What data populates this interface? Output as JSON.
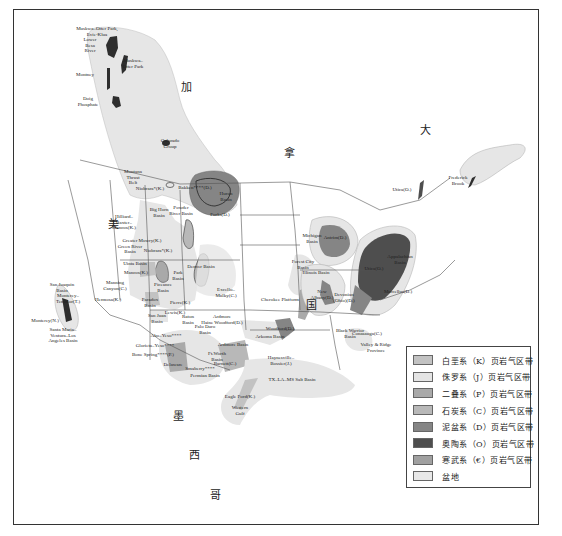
{
  "map": {
    "country_labels": [
      {
        "text": "加",
        "x": 186,
        "y": 84
      },
      {
        "text": "拿",
        "x": 289,
        "y": 150
      },
      {
        "text": "大",
        "x": 425,
        "y": 127
      },
      {
        "text": "美",
        "x": 113,
        "y": 221
      },
      {
        "text": "国",
        "x": 311,
        "y": 302
      },
      {
        "text": "墨",
        "x": 178,
        "y": 413
      },
      {
        "text": "西",
        "x": 194,
        "y": 452
      },
      {
        "text": "哥",
        "x": 215,
        "y": 492
      }
    ],
    "feature_labels": [
      {
        "text": "Muskwa–Otter Park,\nEvie-Klua",
        "x": 97,
        "y": 31
      },
      {
        "text": "Lower\nBesa\nRiver",
        "x": 90,
        "y": 45
      },
      {
        "text": "Muskwa–\nOtter Park",
        "x": 133,
        "y": 63
      },
      {
        "text": "Montney",
        "x": 85,
        "y": 75
      },
      {
        "text": "Doig\nPhosphate",
        "x": 88,
        "y": 101
      },
      {
        "text": "Colorado\nGroup",
        "x": 170,
        "y": 143
      },
      {
        "text": "Montana\nThrust\nBelt",
        "x": 133,
        "y": 177
      },
      {
        "text": "Niobrara*(K.)",
        "x": 150,
        "y": 189
      },
      {
        "text": "Bakken****(D.)",
        "x": 195,
        "y": 188
      },
      {
        "text": "Huron\nBasin",
        "x": 226,
        "y": 196
      },
      {
        "text": "Forks(D.)",
        "x": 220,
        "y": 215
      },
      {
        "text": "Big Horn\nBasin",
        "x": 159,
        "y": 212
      },
      {
        "text": "Powder\nRiver Basin",
        "x": 181,
        "y": 210
      },
      {
        "text": "Hilliard–\nBaxter–\nMancos(K.)",
        "x": 124,
        "y": 222
      },
      {
        "text": "Mowry(K.)",
        "x": 150,
        "y": 241
      },
      {
        "text": "Greater\nGreen River\nBasin",
        "x": 130,
        "y": 246
      },
      {
        "text": "Niobrara*(K.)",
        "x": 158,
        "y": 251
      },
      {
        "text": "Uinta Basin",
        "x": 135,
        "y": 264
      },
      {
        "text": "Mancos(K.)",
        "x": 136,
        "y": 273
      },
      {
        "text": "Park\nBasin",
        "x": 178,
        "y": 275
      },
      {
        "text": "Denver Basin",
        "x": 201,
        "y": 267
      },
      {
        "text": "Manning\nCanyon(C.)",
        "x": 115,
        "y": 285
      },
      {
        "text": "Piceance\nBasin",
        "x": 163,
        "y": 287
      },
      {
        "text": "Hermosa(K.)",
        "x": 108,
        "y": 300
      },
      {
        "text": "Paradox\nBasin",
        "x": 150,
        "y": 302
      },
      {
        "text": "Pierre(K.)",
        "x": 180,
        "y": 303
      },
      {
        "text": "Lewis(K.)",
        "x": 175,
        "y": 313
      },
      {
        "text": "San Juan\nBasin",
        "x": 157,
        "y": 318
      },
      {
        "text": "Raton\nBasin",
        "x": 188,
        "y": 319
      },
      {
        "text": "Excello–\nMulky(C.)",
        "x": 226,
        "y": 292
      },
      {
        "text": "Forest City\nBasin",
        "x": 303,
        "y": 264
      },
      {
        "text": "Cherokee Platform",
        "x": 280,
        "y": 300
      },
      {
        "text": "Michigan\nBasin",
        "x": 312,
        "y": 238
      },
      {
        "text": "Antrim(D.)",
        "x": 335,
        "y": 238
      },
      {
        "text": "Illinois Basin",
        "x": 316,
        "y": 273
      },
      {
        "text": "New\nAlbany(D.)",
        "x": 322,
        "y": 294
      },
      {
        "text": "Devonian\n(Ohio)(D.)",
        "x": 344,
        "y": 297
      },
      {
        "text": "Utica(O.)",
        "x": 374,
        "y": 269
      },
      {
        "text": "Appalachian\nBasin",
        "x": 400,
        "y": 259
      },
      {
        "text": "Marcellus(D.)",
        "x": 398,
        "y": 292
      },
      {
        "text": "Utica(O.)",
        "x": 402,
        "y": 190
      },
      {
        "text": "Frederick\nBrook",
        "x": 458,
        "y": 180
      },
      {
        "text": "Ardmore\nHaine Woodford(D.)",
        "x": 222,
        "y": 319
      },
      {
        "text": "Palo Duro\nBasin",
        "x": 205,
        "y": 329
      },
      {
        "text": "Woodford(D.)",
        "x": 280,
        "y": 329
      },
      {
        "text": "Arkoma Basin",
        "x": 270,
        "y": 337
      },
      {
        "text": "Ardmore Basin",
        "x": 233,
        "y": 345
      },
      {
        "text": "Ft.Worth\nBasin",
        "x": 217,
        "y": 356
      },
      {
        "text": "Barnett(C.)",
        "x": 225,
        "y": 364
      },
      {
        "text": "Black Warrior\nBasin",
        "x": 350,
        "y": 333
      },
      {
        "text": "Conasauga(C.)",
        "x": 367,
        "y": 334
      },
      {
        "text": "Valley & Ridge\nProvince",
        "x": 376,
        "y": 347
      },
      {
        "text": "Haynesville–\nBossier(J.)",
        "x": 281,
        "y": 360
      },
      {
        "text": "TX–LA–MS Salt Basin",
        "x": 292,
        "y": 380
      },
      {
        "text": "Abo–Yeso****",
        "x": 166,
        "y": 336
      },
      {
        "text": "Glorieta–Yeso****",
        "x": 155,
        "y": 346
      },
      {
        "text": "Bone Spring****(P.)",
        "x": 153,
        "y": 355
      },
      {
        "text": "Delaware",
        "x": 173,
        "y": 365
      },
      {
        "text": "Smaberry****",
        "x": 200,
        "y": 369
      },
      {
        "text": "Permian Basin",
        "x": 205,
        "y": 376
      },
      {
        "text": "Eagle Ford(K.)",
        "x": 240,
        "y": 397
      },
      {
        "text": "Western\nGulf",
        "x": 240,
        "y": 410
      },
      {
        "text": "San Joaquin\nBasin",
        "x": 62,
        "y": 287
      },
      {
        "text": "Monterey–\nTemblor(T.)",
        "x": 68,
        "y": 298
      },
      {
        "text": "Monterey(N.)",
        "x": 45,
        "y": 321
      },
      {
        "text": "Santa Maria–\nVentura–Los\nAngeles Basin",
        "x": 63,
        "y": 335
      }
    ]
  },
  "legend": {
    "items": [
      {
        "label": "白垩系（K）页岩气区带",
        "color": "#c2c2c2"
      },
      {
        "label": "侏罗系（J）页岩气区带",
        "color": "#e4e4e4"
      },
      {
        "label": "二叠系（P）页岩气区带",
        "color": "#a9a9a9"
      },
      {
        "label": "石炭系（C）页岩气区带",
        "color": "#b8b8b8"
      },
      {
        "label": "泥盆系（D）页岩气区带",
        "color": "#858585"
      },
      {
        "label": "奥陶系（O）页岩气区带",
        "color": "#4e4e4e"
      },
      {
        "label": "寒武系（€）页岩气区带",
        "color": "#a0a0a0"
      },
      {
        "label": "盆地",
        "color": "#e8e8e8"
      }
    ]
  },
  "colors": {
    "basin": "#e6e6e6",
    "cretaceous": "#c2c2c2",
    "devonian": "#858585",
    "ordovician": "#4e4e4e",
    "permian": "#a9a9a9",
    "carboniferous": "#b8b8b8",
    "border": "#555555"
  }
}
